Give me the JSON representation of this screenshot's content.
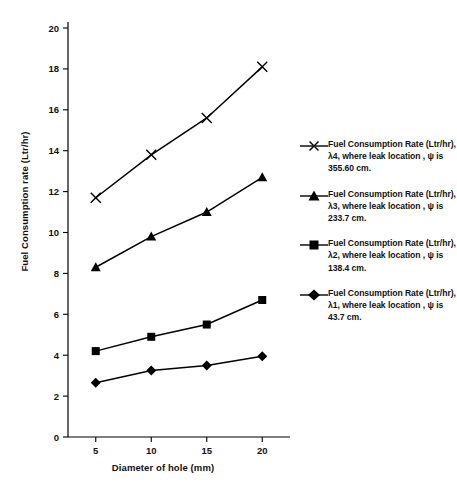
{
  "chart_data": {
    "type": "line",
    "title": "",
    "xlabel": "Diameter of hole (mm)",
    "ylabel": "Fuel Consumption rate (Ltr/hr)",
    "x": [
      5,
      10,
      15,
      20
    ],
    "xticklabels": [
      "5",
      "10",
      "15",
      "20"
    ],
    "yticklabels": [
      "0",
      "2",
      "4",
      "6",
      "8",
      "10",
      "12",
      "14",
      "16",
      "18",
      "20"
    ],
    "xlim": [
      2.5,
      22.5
    ],
    "ylim": [
      0,
      20
    ],
    "grid": false,
    "legend_position": "right",
    "series": [
      {
        "name": "Fuel Consumption Rate (Ltr/hr), λ4, where leak location , ψ is 355.60 cm.",
        "marker": "x",
        "color": "#000000",
        "values": [
          11.7,
          13.8,
          15.6,
          18.1
        ]
      },
      {
        "name": "Fuel Consumption Rate (Ltr/hr), λ3, where leak location , ψ is 233.7 cm.",
        "marker": "triangle",
        "color": "#000000",
        "values": [
          8.3,
          9.8,
          11.0,
          12.7
        ]
      },
      {
        "name": "Fuel Consumption Rate (Ltr/hr), λ2, where leak location , ψ is 138.4 cm.",
        "marker": "square",
        "color": "#000000",
        "values": [
          4.2,
          4.9,
          5.5,
          6.7
        ]
      },
      {
        "name": "Fuel Consumption Rate (Ltr/hr), λ1, where leak location , ψ is 43.7 cm.",
        "marker": "diamond",
        "color": "#000000",
        "values": [
          2.65,
          3.25,
          3.5,
          3.95
        ]
      }
    ]
  },
  "legend": {
    "items": [
      {
        "marker": "x",
        "label": "Fuel Consumption Rate (Ltr/hr), λ4, where leak location , ψ is 355.60 cm."
      },
      {
        "marker": "triangle",
        "label": "Fuel Consumption Rate (Ltr/hr), λ3, where leak location , ψ is 233.7 cm."
      },
      {
        "marker": "square",
        "label": "Fuel Consumption Rate (Ltr/hr), λ2, where leak location , ψ is 138.4 cm."
      },
      {
        "marker": "diamond",
        "label": "Fuel Consumption Rate (Ltr/hr), λ1, where leak location , ψ is 43.7 cm."
      }
    ]
  }
}
